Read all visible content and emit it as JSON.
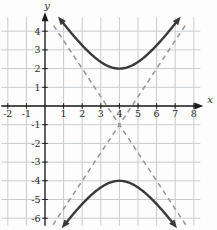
{
  "chart_data": {
    "type": "line",
    "subtype": "hyperbola-with-asymptotes",
    "equation": "(y+1)^2/9 - (x-4)^2/4 = 1",
    "center": {
      "h": 4,
      "k": -1
    },
    "a": 3,
    "b": 2,
    "transverse_axis": "vertical",
    "vertices": [
      [
        4,
        2
      ],
      [
        4,
        -4
      ]
    ],
    "branches": [
      {
        "name": "upper",
        "vertex": [
          4,
          2
        ],
        "x_extent": [
          0.85,
          7.15
        ]
      },
      {
        "name": "lower",
        "vertex": [
          4,
          -4
        ],
        "x_extent": [
          1.05,
          6.95
        ]
      }
    ],
    "asymptotes": [
      {
        "slope": 1.5,
        "equation": "y = -1 + (3/2)(x - 4)",
        "y_extent": [
          -6.35,
          4.35
        ]
      },
      {
        "slope": -1.5,
        "equation": "y = -1 - (3/2)(x - 4)",
        "y_extent": [
          -6.35,
          4.45
        ]
      }
    ],
    "axes": {
      "x_label": "x",
      "y_label": "y",
      "x_tick_labels": [
        -2,
        -1,
        1,
        2,
        3,
        4,
        5,
        6,
        7,
        8
      ],
      "y_tick_labels": [
        -6,
        -5,
        -4,
        -3,
        -2,
        -1,
        1,
        2,
        3,
        4
      ],
      "x_range": [
        -2.35,
        8.35
      ],
      "y_range": [
        -6.4,
        4.75
      ],
      "grid": true
    },
    "colors": {
      "curve": "#3a3a3a",
      "asymptote": "#979797",
      "grid": "#c9cccf",
      "axis": "#1c1c1c",
      "label": "#2a2a2a",
      "background": "#fdfdfd"
    }
  }
}
